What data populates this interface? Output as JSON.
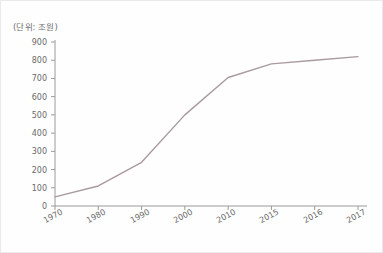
{
  "chart_data": {
    "type": "line",
    "title": "",
    "unit_note": "(단위: 조원)",
    "xlabel": "",
    "ylabel": "",
    "categories": [
      "1970",
      "1980",
      "1990",
      "2000",
      "2010",
      "2015",
      "2016",
      "2017"
    ],
    "x_tick_labels": [
      "1970",
      "1980",
      "1990",
      "2000",
      "2010",
      "2015",
      "2016",
      "2017"
    ],
    "y_tick_labels": [
      "0",
      "100",
      "200",
      "300",
      "400",
      "500",
      "600",
      "700",
      "800",
      "900"
    ],
    "y_ticks": [
      0,
      100,
      200,
      300,
      400,
      500,
      600,
      700,
      800,
      900
    ],
    "ylim": [
      0,
      900
    ],
    "values": [
      50,
      110,
      240,
      500,
      705,
      780,
      800,
      820
    ],
    "series": [
      {
        "name": "",
        "values": [
          50,
          110,
          240,
          500,
          705,
          780,
          800,
          820
        ]
      }
    ],
    "grid": false,
    "legend": false,
    "line_color": "#a99aa2"
  },
  "axes": {
    "axis_color": "#9a9a9a",
    "tick_color": "#9a9a9a",
    "label_color": "#6a6a6a"
  }
}
